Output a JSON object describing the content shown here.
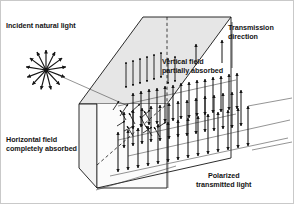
{
  "figure": {
    "background_color": "#ffffff",
    "ink_color": "#141414",
    "slab_face_color": "#f2f2f2",
    "slab_top_color": "#e4e4e4"
  },
  "labels": {
    "incident": "Incident natural light",
    "transmission_line1": "Transmission",
    "transmission_line2": "direction",
    "vertical_line1": "Vertical field",
    "vertical_line2": "partially absorbed",
    "horizontal_line1": "Horizontal field",
    "horizontal_line2": "completely absorbed",
    "polarized_line1": "Polarized",
    "polarized_line2": "transmitted light"
  },
  "diagram": {
    "starburst": {
      "name": "unpolarized-light-burst",
      "center_x": 46,
      "center_y": 70,
      "ray_count": 13,
      "ray_length": 21
    },
    "incident_ray": {
      "from_x": 56,
      "from_y": 74,
      "to_x": 126,
      "to_y": 104
    },
    "transmission_arrow": {
      "x": 222,
      "y_top": 40,
      "y_bottom": 62
    },
    "vertical_field_arrow": {
      "x": 196,
      "y_top": 44,
      "y_bottom": 64
    },
    "polarized_rows": 3,
    "polarized_arrows_per_row": 14
  }
}
